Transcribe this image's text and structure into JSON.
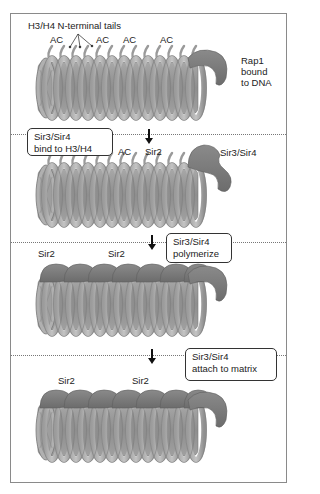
{
  "colors": {
    "frame_border": "#8a8a8a",
    "coil_light": "#b8b8b8",
    "coil_dark": "#8c8c8c",
    "core": "#9a9a9a",
    "protein": "#7d7d7d",
    "protein_dark": "#6a6a6a",
    "text": "#222222"
  },
  "panel1": {
    "tails_label": "H3/H4 N-terminal tails",
    "ac_labels": [
      "AC",
      "AC",
      "AC",
      "AC"
    ],
    "rap1_label": [
      "Rap1",
      "bound",
      "to DNA"
    ]
  },
  "panel2": {
    "step_box": [
      "Sir3/Sir4",
      "bind to H3/H4"
    ],
    "ac_label": "AC",
    "sir2_label": "Sir2",
    "sir34_label": "Sir3/Sir4"
  },
  "panel3": {
    "step_box": [
      "Sir3/Sir4",
      "polymerize"
    ],
    "sir2_labels": [
      "Sir2",
      "Sir2"
    ]
  },
  "panel4": {
    "step_box": [
      "Sir3/Sir4",
      "attach to matrix"
    ],
    "sir2_labels": [
      "Sir2",
      "Sir2"
    ]
  }
}
